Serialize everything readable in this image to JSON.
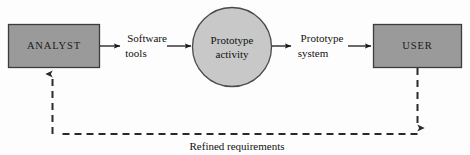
{
  "diagram": {
    "background_color": "#fdfdfd",
    "box_fill_color": "#9a9a9a",
    "box_stroke_color": "#3c3c3c",
    "circle_fill_color": "#c8c8c8",
    "circle_stroke_color": "#4a4a4a",
    "line_color": "#1a1a1a",
    "dashed_line_color": "#2a2a2a",
    "nodes": {
      "analyst": "ANALYST",
      "prototype_activity_line1": "Prototype",
      "prototype_activity_line2": "activity",
      "user": "USER"
    },
    "edges": {
      "software_tools_line1": "Software",
      "software_tools_line2": "tools",
      "prototype_system_line1": "Prototype",
      "prototype_system_line2": "system",
      "refined_requirements": "Refined requirements"
    }
  }
}
